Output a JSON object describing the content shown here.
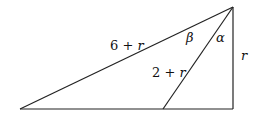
{
  "diagram": {
    "type": "geometry-triangle",
    "vertices": {
      "top": [
        233,
        7
      ],
      "left": [
        20,
        109
      ],
      "inner_base": [
        163,
        109
      ],
      "right_base": [
        233,
        109
      ]
    },
    "labels": {
      "hypotenuse": {
        "num": "6",
        "op": "+",
        "var": "r"
      },
      "inner": {
        "num": "2",
        "op": "+",
        "var": "r"
      },
      "vertical": {
        "var": "r"
      },
      "angle_beta": "β",
      "angle_alpha": "α"
    }
  }
}
